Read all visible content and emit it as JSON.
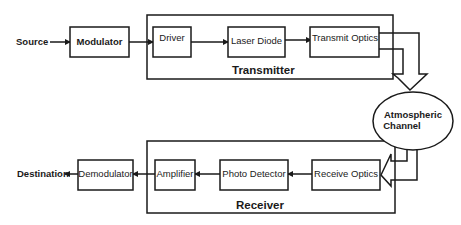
{
  "diagram": {
    "source_label": "Source",
    "destination_label": "Destination",
    "transmitter": {
      "label": "Transmitter",
      "blocks": [
        "Driver",
        "Laser Diode",
        "Transmit Optics"
      ]
    },
    "receiver": {
      "label": "Receiver",
      "blocks": [
        "Amplifier",
        "Photo Detector",
        "Receive Optics"
      ]
    },
    "modulator_label": "Modulator",
    "demodulator_label": "Demodulator",
    "channel": {
      "line1": "Atmospheric",
      "line2": "Channel"
    },
    "colors": {
      "stroke": "#1a1a1a",
      "background": "#ffffff"
    }
  }
}
